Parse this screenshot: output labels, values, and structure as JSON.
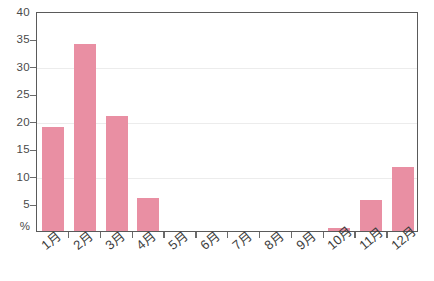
{
  "chart_data": {
    "type": "bar",
    "title": "",
    "subtitle": "",
    "xlabel": "",
    "ylabel": "%",
    "categories": [
      "1月",
      "2月",
      "3月",
      "4月",
      "5月",
      "6月",
      "7月",
      "8月",
      "9月",
      "10月",
      "11月",
      "12月"
    ],
    "values": [
      19,
      34,
      21,
      6,
      0,
      0,
      0,
      0,
      0,
      0.6,
      5.6,
      11.6
    ],
    "ylim": [
      0,
      40
    ],
    "ytick_values": [
      40,
      35,
      30,
      25,
      20,
      15,
      10,
      5
    ],
    "ytick_labels": [
      "40",
      "35",
      "30",
      "25",
      "20",
      "15",
      "10",
      "5"
    ],
    "y_unit_label": "%",
    "gridlines": [
      30,
      20,
      10
    ],
    "grid": true,
    "legend": null,
    "legend_position": "none",
    "bar_color": "#e98fa3",
    "axis_color": "#5a5a5a",
    "grid_color": "#ececec",
    "text_color": "#3d3d3d"
  }
}
